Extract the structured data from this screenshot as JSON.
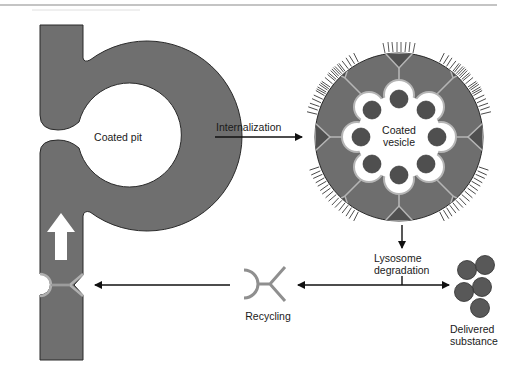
{
  "labels": {
    "coated_pit": "Coated pit",
    "internalization": "Internalization",
    "coated_vesicle_line1": "Coated",
    "coated_vesicle_line2": "vesicle",
    "lysosome_line1": "Lysosome",
    "lysosome_line2": "degradation",
    "recycling": "Recycling",
    "delivered_line1": "Delivered",
    "delivered_line2": "substance"
  },
  "colors": {
    "membrane": "#6f6f6f",
    "membrane_outline": "#2a2a2a",
    "coat_light": "#a9a9a9",
    "ligand": "#4f4f4f",
    "triangle": "#505050",
    "arrow": "#111111",
    "rule": "#8a8a8a"
  },
  "icons": {
    "up_arrow": "white-up-arrow-icon",
    "receptor": "y-receptor-icon"
  }
}
